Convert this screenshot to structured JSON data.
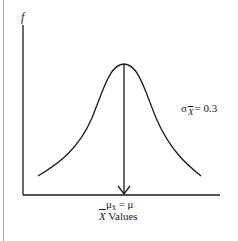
{
  "diagram": {
    "type": "normal-sampling-distribution",
    "y_axis_label": "f",
    "x_axis_label": {
      "symbol": "X",
      "text": "Values"
    },
    "mean_label": {
      "symbol": "μ",
      "subscript": "x̄",
      "equals": "= μ"
    },
    "std_label": {
      "symbol": "σ",
      "subscript": "X",
      "equals": "= 0.3"
    },
    "colors": {
      "line": "#1a1a1a",
      "border": "#a8a8a8",
      "background": "#ffffff"
    }
  }
}
